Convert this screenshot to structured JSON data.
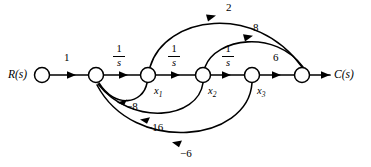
{
  "figure": {
    "type": "signal-flow-graph",
    "background_color": "#ffffff",
    "line_color": "#000000",
    "width": 371,
    "height": 167
  },
  "io": {
    "input_label": "R(s)",
    "output_label": "C(s)"
  },
  "nodes": [
    {
      "id": "R",
      "label": "",
      "x": 42,
      "y": 75
    },
    {
      "id": "n2",
      "label": "",
      "x": 96,
      "y": 75
    },
    {
      "id": "x1",
      "label": "x₁",
      "x": 148,
      "y": 75
    },
    {
      "id": "x2",
      "label": "x₂",
      "x": 203,
      "y": 75
    },
    {
      "id": "x3",
      "label": "x₃",
      "x": 252,
      "y": 75
    },
    {
      "id": "C",
      "label": "",
      "x": 302,
      "y": 75
    }
  ],
  "node_labels": {
    "x1": "x",
    "x1_sub": "1",
    "x2": "x",
    "x2_sub": "2",
    "x3": "x",
    "x3_sub": "3"
  },
  "edges": [
    {
      "name": "edge-R-to-n2",
      "from": "R",
      "to": "n2",
      "gain": "1",
      "kind": "straight",
      "label_pos": "above"
    },
    {
      "name": "edge-n2-to-x1",
      "from": "n2",
      "to": "x1",
      "gain": "1/s",
      "kind": "straight",
      "label_pos": "above"
    },
    {
      "name": "edge-x1-to-x2",
      "from": "x1",
      "to": "x2",
      "gain": "1/s",
      "kind": "straight",
      "label_pos": "above"
    },
    {
      "name": "edge-x2-to-x3",
      "from": "x2",
      "to": "x3",
      "gain": "1/s",
      "kind": "straight",
      "label_pos": "above"
    },
    {
      "name": "edge-x3-to-C",
      "from": "x3",
      "to": "C",
      "gain": "6",
      "kind": "straight",
      "label_pos": "above"
    },
    {
      "name": "edge-x1-to-C",
      "from": "x1",
      "to": "C",
      "gain": "2",
      "kind": "arc-above",
      "label_pos": "above"
    },
    {
      "name": "edge-x2-to-C",
      "from": "x2",
      "to": "C",
      "gain": "8",
      "kind": "arc-above",
      "label_pos": "above"
    },
    {
      "name": "edge-x1-to-n2",
      "from": "x1",
      "to": "n2",
      "gain": "−8",
      "kind": "arc-below",
      "label_pos": "below"
    },
    {
      "name": "edge-x2-to-n2",
      "from": "x2",
      "to": "n2",
      "gain": "−16",
      "kind": "arc-below",
      "label_pos": "below"
    },
    {
      "name": "edge-x3-to-n2",
      "from": "x3",
      "to": "n2",
      "gain": "−6",
      "kind": "arc-below",
      "label_pos": "below"
    }
  ],
  "gains": {
    "g_r_n2": "1",
    "g_n2_x1_num": "1",
    "g_n2_x1_den": "s",
    "g_x1_x2_num": "1",
    "g_x1_x2_den": "s",
    "g_x2_x3_num": "1",
    "g_x2_x3_den": "s",
    "g_x3_c": "6",
    "g_ff_x1_c": "2",
    "g_ff_x2_c": "8",
    "g_fb_x1_n2": "−8",
    "g_fb_x2_n2": "−16",
    "g_fb_x3_n2": "−6"
  }
}
